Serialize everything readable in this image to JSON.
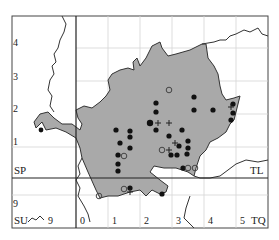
{
  "map": {
    "type": "distribution-dot-map",
    "colors": {
      "county_fill": "#a8a8a8",
      "border": "#333333",
      "grid": "#d0d0d0",
      "grid_major": "#222222",
      "dot": "#111111",
      "open_circle": "#555555"
    },
    "grid_squares": {
      "sp": "SP",
      "tl": "TL",
      "su": "SU",
      "tq": "TQ"
    },
    "axis_labels": {
      "left": [
        "4",
        "3",
        "2",
        "1",
        "9"
      ],
      "bottom": [
        "0",
        "1",
        "2",
        "3",
        "4",
        "5"
      ],
      "su_easting": "9"
    },
    "legend_symbols": {
      "filled_dot": "record (recent)",
      "open_circle": "record (older)",
      "plus": "record (uncertain)"
    }
  }
}
